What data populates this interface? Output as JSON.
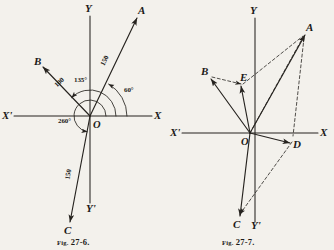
{
  "page": {
    "background_color": "#f3f1ec",
    "ink_color": "#26231f"
  },
  "figures": [
    {
      "id": "fig-27-6",
      "caption_prefix": "Fig.",
      "caption_number": "27-6.",
      "axis_labels": {
        "x": "X",
        "x_neg": "X'",
        "y": "Y",
        "y_neg": "Y'"
      },
      "origin_label": "O",
      "vectors": [
        {
          "name": "A",
          "label": "A",
          "magnitude": "150",
          "angle": "60°"
        },
        {
          "name": "B",
          "label": "B",
          "magnitude": "100",
          "angle": "135°"
        },
        {
          "name": "C",
          "label": "C",
          "magnitude": "150",
          "angle": "260°"
        }
      ],
      "arc_labels": [
        "60°",
        "135°",
        "260°"
      ]
    },
    {
      "id": "fig-27-7",
      "caption_prefix": "Fig.",
      "caption_number": "27-7.",
      "axis_labels": {
        "x": "X",
        "x_neg": "X'",
        "y": "Y",
        "y_neg": "Y'"
      },
      "origin_label": "O",
      "points": [
        {
          "name": "A",
          "label": "A"
        },
        {
          "name": "B",
          "label": "B"
        },
        {
          "name": "C",
          "label": "C"
        },
        {
          "name": "D",
          "label": "D"
        },
        {
          "name": "E",
          "label": "E"
        }
      ]
    }
  ]
}
